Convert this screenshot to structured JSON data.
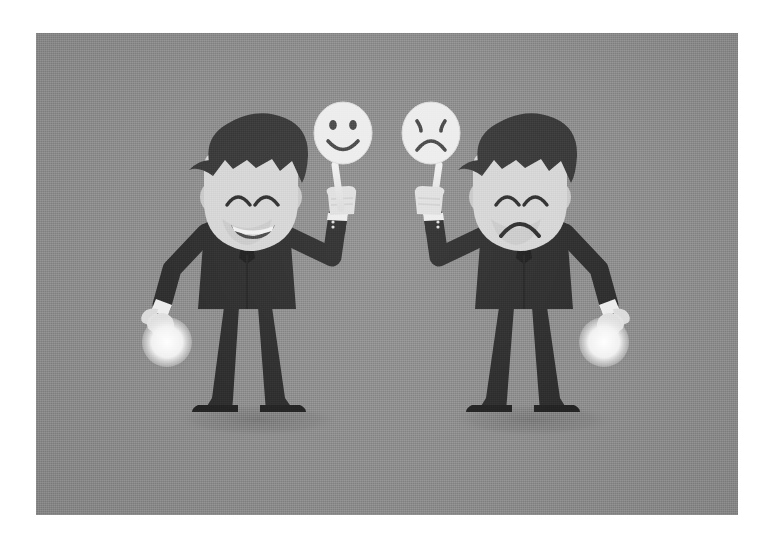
{
  "canvas": {
    "width": 773,
    "height": 544,
    "background_color": "#ffffff"
  },
  "panel": {
    "x": 36,
    "y": 33,
    "width": 702,
    "height": 482,
    "background_color": "#8e8e8e",
    "texture": "halftone-noise",
    "caption": "Two cartoon businessmen holding emotion masks on sticks"
  },
  "palette": {
    "background_gray": "#8e8e8e",
    "suit_dark": "#2e2e2e",
    "hair_dark": "#3a3a3a",
    "skin_light": "#d6d6d6",
    "skin_shadow": "#c2c2c2",
    "mask_white": "#ededed",
    "mask_line": "#555555",
    "shirt_white": "#e8e8e8",
    "tie_dark": "#1f1f1f",
    "shadow_gray": "#7d7d7d",
    "glow_white": "#f2f2f2"
  },
  "characters": [
    {
      "id": "left-businessman",
      "label": "Happy businessman",
      "position": "left",
      "face_expression": "smiling",
      "eyes": "closed-arched",
      "mouth": "wide-open-smile",
      "hair_style": "side-swept-dark",
      "outfit": "dark business suit with white collar and dark tie",
      "raised_arm": "right",
      "held_mask": "happy-mask",
      "other_hand": "open-palm-with-white-orb",
      "shadow": "ellipse"
    },
    {
      "id": "right-businessman",
      "label": "Sad businessman",
      "position": "right",
      "face_expression": "frowning",
      "eyes": "closed-arched",
      "mouth": "frown",
      "hair_style": "side-swept-dark",
      "outfit": "dark business suit with white collar and dark tie",
      "raised_arm": "left",
      "held_mask": "sad-mask",
      "other_hand": "open-palm-with-white-orb",
      "shadow": "ellipse"
    }
  ],
  "masks": [
    {
      "id": "happy-mask",
      "label": "Happy face mask",
      "expression": "smiley",
      "eyes": "two round dots",
      "mouth": "upward curved smile",
      "fill_color": "#ededed",
      "line_color": "#555555",
      "handle": "stick"
    },
    {
      "id": "sad-mask",
      "label": "Sad face mask",
      "expression": "frowny",
      "eyes": "two slanted tick marks",
      "mouth": "downward curved frown",
      "fill_color": "#ededed",
      "line_color": "#555555",
      "handle": "stick"
    }
  ],
  "orbs": [
    {
      "id": "left-orb",
      "label": "White glowing orb in left man's hand"
    },
    {
      "id": "right-orb",
      "label": "White glowing orb in right man's hand"
    }
  ]
}
